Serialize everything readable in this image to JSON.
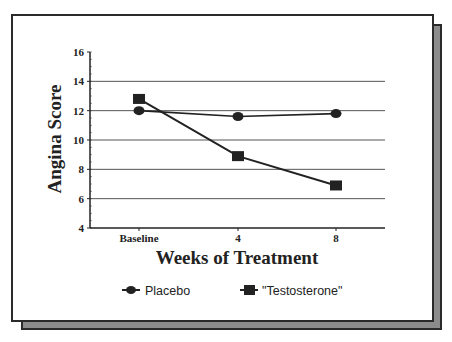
{
  "chart_data": {
    "type": "line",
    "title": "",
    "xlabel": "Weeks of Treatment",
    "ylabel": "Angina Score",
    "categories": [
      "Baseline",
      "4",
      "8"
    ],
    "ylim": [
      4,
      16
    ],
    "yticks": [
      4,
      6,
      8,
      10,
      12,
      14,
      16
    ],
    "grid": true,
    "legend_position": "bottom",
    "series": [
      {
        "name": "Placebo",
        "marker": "circle",
        "values": [
          12.0,
          11.6,
          11.8
        ]
      },
      {
        "name": "\"Testosterone\"",
        "marker": "square",
        "values": [
          12.8,
          8.9,
          6.9
        ]
      }
    ]
  },
  "axis": {
    "yticks_labels": [
      "4",
      "6",
      "8",
      "10",
      "12",
      "14",
      "16"
    ],
    "xticks_labels": [
      "Baseline",
      "4",
      "8"
    ]
  },
  "legend": {
    "items": [
      {
        "label": "Placebo",
        "marker": "circle"
      },
      {
        "label": "\"Testosterone\"",
        "marker": "square"
      }
    ]
  },
  "colors": {
    "line": "#222222",
    "grid": "#555555",
    "shadow": "#8c8c8c"
  }
}
